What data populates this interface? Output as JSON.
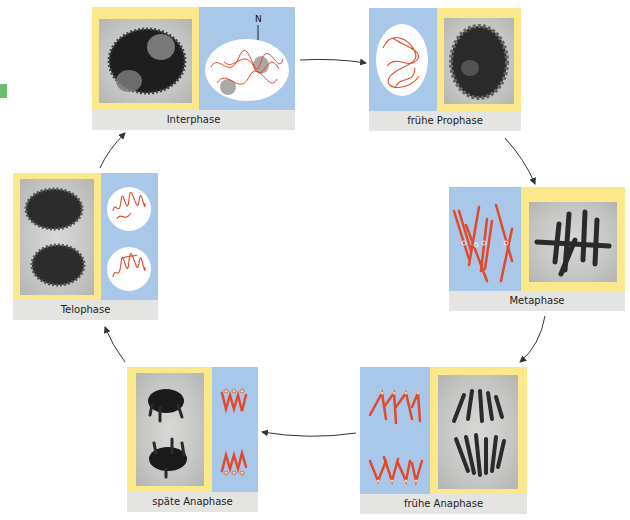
{
  "diagram": {
    "colors": {
      "photo_frame": "#fbe88a",
      "schematic_bg": "#a9c7e8",
      "caption_bg": "#e4e4e3",
      "chromosome": "#e2492a",
      "nucleus": "#ffffff",
      "nucleolus": "#a9a9a9",
      "arrow": "#333333"
    },
    "phases": [
      {
        "id": "interphase",
        "label": "Interphase",
        "schematic_annotation": "N"
      },
      {
        "id": "fruehe-prophase",
        "label": "frühe Prophase"
      },
      {
        "id": "metaphase",
        "label": "Metaphase"
      },
      {
        "id": "fruehe-anaphase",
        "label": "frühe Anaphase"
      },
      {
        "id": "spaete-anaphase",
        "label": "späte Anaphase"
      },
      {
        "id": "telophase",
        "label": "Telophase"
      }
    ],
    "cycle_order": [
      "Interphase",
      "frühe Prophase",
      "Metaphase",
      "frühe Anaphase",
      "späte Anaphase",
      "Telophase",
      "Interphase"
    ]
  }
}
